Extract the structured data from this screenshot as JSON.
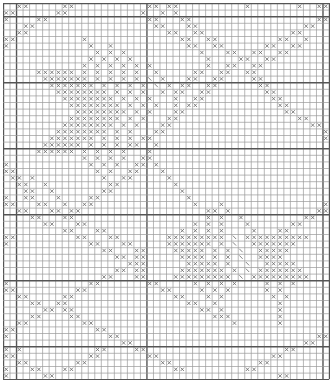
{
  "chart_title": "",
  "grid": {
    "cols": 50,
    "rows": 57,
    "cell_w": 6.52,
    "cell_h": 6.6,
    "thin_line_color": "#9a9a9a",
    "thick_line_color": "#555555",
    "thick_cols": [
      2,
      22,
      49
    ],
    "thick_rows": [
      2,
      12,
      22,
      32,
      42,
      52
    ],
    "legend": {
      "x": "cross stitch",
      "\\": "slash stitch"
    }
  },
  "symbols": {
    "x": "×",
    "s": "╲"
  },
  "rows": [
    "..xx.....xx...........xx.xx..........x.......x..xx",
    "xx......xx...........x..x.x.......................xx",
    "x....xx...............xx...xx...................xx..",
    "...xx..................xx...xx................xx....",
    "..xx.....................xx..xx.............xx......",
    "xx..........x..............xx..xx.........xx..x.....",
    "x............x..x...........xx..xx......xx..xx.....x",
    "..............x.x.x...........x...xx..xx..xx........",
    ".............x.x.x.x...........x....xx..xx..........",
    "............x.x.x.x.x.x........x..xx..xx............",
    ".....xxxxxx.x.x.x.x.x..x.....xx..xx..xx..............",
    "......xxxxxxx.x.x.x.x.s.x...xx..xx....xx.............",
    ".......xxxxxxx.x.x.x.x.s.x.xx..xx......xx............",
    "........xxxxxxxx.x.x.x..x.xx..xx........xx...........",
    ".........xxxxxxxx.x.x.x...x..xx..........xx..........",
    "..........xxxxxxxx.x.x.x..x.xx............xx.........",
    "...........xxxxxxxx.x.x...xx...............xx........",
    "..........xxxxxxxx.x.x...xx..................xx......",
    ".........xxxxxxxx.x.x...xx.....................xx....",
    "........xxxxxxxx.x.x...xx........................xx..",
    ".......xxxxxxx.x.x.x.xx..........................x..",
    "......xxxxxx.x.x.x.xx..x..........................x",
    ".....xxxxxx.x.x.x.x...x...........................",
    "............x.x.x.x..xx...........................",
    "x............x.x.x..xx.x..........................",
    "xx............x.x..xx...x.........................",
    ".xx.x..........x..xx.....x........................",
    "..xx..x.........xx........x.......................",
    "...xx..x.......xx..........x......................",
    "x..xx...x....xx.............x.....................",
    "xx...xx..x..xx...............x...x...............xx",
    "..xx...xx.xx...................xx.x.............xx.",
    "....xx...xx....................x.x..x.........xx...",
    "......xx...xx................x.x.x...x......xx.....",
    ".........xx...xx...........x.x.x.x....x...xx.......",
    "xx.........xx...xx.......xxxxxxxxx.s.xxxxxxxxxx...",
    "x............xx...xx.....xxxxxxx.x.s..xxxxxxx.....",
    "...............xx...xx....xxxxx.x.x.s..xxxxx......",
    ".................xx.xx.....xxxx.x.x.s..xxxx.......",
    "...................xxx......xxxxx.x..s..xxxxx.....",
    ".................xx.xx.....xxxxxxx.x.s.xxxxxxx....",
    "...............xx...xx....xxxxxxxxx.s.xxxxxxxxx...",
    "x............xx.......xx.....x.x.x.x....x.x.x....",
    "xx.........xx...........xx....x.x.x.....x.x......",
    "..xx.....xx...............xx...x.x.......x.x.....",
    "....xx..xx..................xx..x.........x......",
    "......xx.xx...................xx.x........x......",
    "....xx....xx....................xxx.......x......",
    "..xx........xx.....................x......x......",
    "xx............xx..................................x",
    "x...............xx..............................xx",
    "..................xx..........................xx..",
    "x.x...........xx....xx.....................xx....",
    "xx...........xx.......xx.................xx......",
    "..xx.......xx...........xx.............xx........",
    "x...xx...xx...............xx.........xx..........",
    "x.....xx..................................xx....."
  ]
}
